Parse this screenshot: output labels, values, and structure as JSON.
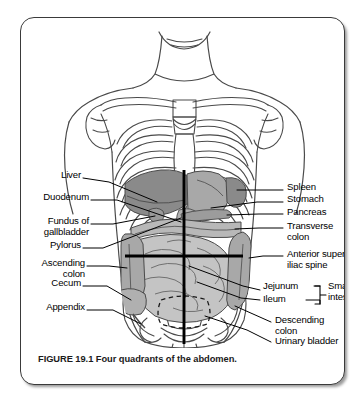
{
  "figure": {
    "caption": "FIGURE 19.1 Four quadrants of the abdomen.",
    "title": "Four quadrants of the abdomen",
    "number": "19.1"
  },
  "colors": {
    "outline": "#3a3a3a",
    "organ_dark": "#8a8a8a",
    "organ_mid": "#a8a8a8",
    "organ_light": "#c4c4c4",
    "organ_pale": "#d8d8d8",
    "bone": "#ffffff",
    "quadrant_line": "#000000",
    "leader_line": "#000000",
    "background": "#ffffff",
    "text": "#000000"
  },
  "labels_left": [
    {
      "id": "liver",
      "text": "Liver"
    },
    {
      "id": "duodenum",
      "text": "Duodenum"
    },
    {
      "id": "fundus-gallbladder",
      "text": "Fundus of"
    },
    {
      "id": "fundus-gallbladder2",
      "text": "gallbladder"
    },
    {
      "id": "pylorus",
      "text": "Pylorus"
    },
    {
      "id": "ascending-colon",
      "text": "Ascending"
    },
    {
      "id": "ascending-colon2",
      "text": "colon"
    },
    {
      "id": "cecum",
      "text": "Cecum"
    },
    {
      "id": "appendix",
      "text": "Appendix"
    }
  ],
  "labels_right": [
    {
      "id": "spleen",
      "text": "Spleen"
    },
    {
      "id": "stomach",
      "text": "Stomach"
    },
    {
      "id": "pancreas",
      "text": "Pancreas"
    },
    {
      "id": "transverse-colon",
      "text": "Transverse"
    },
    {
      "id": "transverse-colon2",
      "text": "colon"
    },
    {
      "id": "asis",
      "text": "Anterior superior"
    },
    {
      "id": "asis2",
      "text": "iliac spine"
    },
    {
      "id": "jejunum",
      "text": "Jejunum"
    },
    {
      "id": "ileum",
      "text": "Ileum"
    },
    {
      "id": "small-intestine",
      "text": "Small"
    },
    {
      "id": "small-intestine2",
      "text": "intestine"
    },
    {
      "id": "descending-colon",
      "text": "Descending"
    },
    {
      "id": "descending-colon2",
      "text": "colon"
    },
    {
      "id": "urinary-bladder",
      "text": "Urinary bladder"
    }
  ],
  "illustration": {
    "subject": "anterior view of human torso with skeleton and abdominal organs",
    "quadrant_lines": "vertical midline and horizontal transumbilical line dividing abdomen into four quadrants",
    "structures": [
      "chin",
      "neck",
      "shoulders",
      "clavicle",
      "scapula",
      "rib cage",
      "sternum",
      "costal cartilage",
      "pelvis",
      "ilium",
      "sacrum",
      "femur",
      "liver",
      "stomach",
      "spleen",
      "pancreas",
      "duodenum",
      "gallbladder",
      "transverse colon",
      "ascending colon",
      "descending colon",
      "small intestine",
      "cecum",
      "appendix",
      "urinary bladder"
    ]
  }
}
